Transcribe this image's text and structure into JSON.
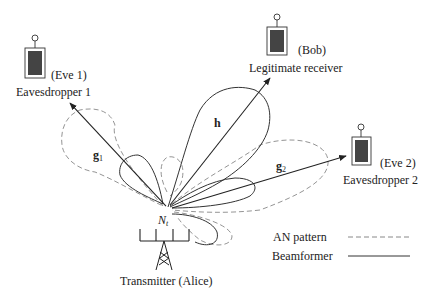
{
  "diagram": {
    "type": "wireless physical-layer security beamforming with artificial noise",
    "transmitter": {
      "label": "Transmitter",
      "name": "(Alice)",
      "antenna_label_base": "N",
      "antenna_label_sub": "t"
    },
    "legitimate_receiver": {
      "label": "Legitimate receiver",
      "name": "(Bob)",
      "channel": "h"
    },
    "eavesdroppers": [
      {
        "label": "Eavesdropper 1",
        "name": "(Eve 1)",
        "channel_base": "g",
        "channel_sub": "1"
      },
      {
        "label": "Eavesdropper 2",
        "name": "(Eve 2)",
        "channel_base": "g",
        "channel_sub": "2"
      }
    ],
    "legend": [
      {
        "label": "AN pattern",
        "style": "dashed"
      },
      {
        "label": "Beamformer",
        "style": "solid"
      }
    ],
    "colors": {
      "line": "#333333",
      "dashed": "#888888",
      "device_fill": "#444444"
    }
  }
}
